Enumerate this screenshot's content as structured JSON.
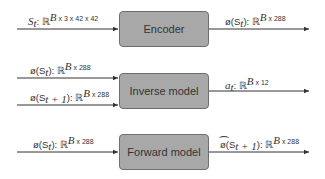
{
  "diagram": {
    "blocks": [
      {
        "id": "encoder",
        "label": "Encoder"
      },
      {
        "id": "inverse",
        "label": "Inverse model"
      },
      {
        "id": "forward",
        "label": "Forward model"
      }
    ],
    "edges": {
      "encoder_in": {
        "var": "S",
        "sub": "t",
        "space": ": ℝ",
        "shape": "B x 3 x 42 x 42"
      },
      "encoder_out": {
        "var": "ø(S",
        "sub": "t",
        "close": "): ℝ",
        "shape": "B x 288"
      },
      "inverse_in1": {
        "var": "ø(S",
        "sub": "t",
        "close": "): ℝ",
        "shape": "B x 288"
      },
      "inverse_in2": {
        "var": "ø(S",
        "sub": "t + 1",
        "close": "): ℝ",
        "shape": "B x 288"
      },
      "inverse_out": {
        "var": "a",
        "sub": "t",
        "close": ": ℝ",
        "shape": "B x 12"
      },
      "forward_in": {
        "var": "ø(S",
        "sub": "t",
        "close": "): ℝ",
        "shape": "B x 288"
      },
      "forward_out": {
        "hat": "ø",
        "var": "(S",
        "sub": "t + 1",
        "close": "): ℝ",
        "shape": "B x 288"
      }
    },
    "colors": {
      "box_fill": "#a8a8a8",
      "box_border": "#6e6e6e",
      "line": "#333333"
    }
  }
}
